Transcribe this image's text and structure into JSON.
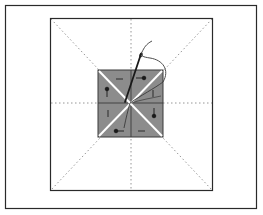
{
  "diagram": {
    "colors": {
      "background": "#ffffff",
      "frame": "#2a2a2a",
      "guide_dots": "#8a8a8a",
      "fabric_fill": "#8c8c8c",
      "fabric_edge": "#3a3a3a",
      "fold_lines": "#ffffff",
      "needle": "#1a1a1a",
      "thread": "#3a3a3a",
      "pins": "#1a1a1a"
    },
    "outer_frame": {
      "x": 5,
      "y": 5,
      "w": 252,
      "h": 204
    },
    "block_square": {
      "x": 50,
      "y": 18,
      "w": 163,
      "h": 172
    },
    "center_square": {
      "x": 98,
      "y": 70,
      "w": 65,
      "h": 67
    },
    "guide_lines": [
      "vertical-center",
      "horizontal-center",
      "diagonal-tl-br",
      "diagonal-tr-bl"
    ],
    "pins": [
      {
        "name": "pin-top-right",
        "head": [
          142,
          78
        ],
        "dir": "left"
      },
      {
        "name": "pin-right",
        "head": [
          154,
          116
        ],
        "dir": "up"
      },
      {
        "name": "pin-bottom-left",
        "head": [
          116,
          130
        ],
        "dir": "right"
      },
      {
        "name": "pin-left",
        "head": [
          106,
          89
        ],
        "dir": "down"
      }
    ],
    "labels": []
  }
}
